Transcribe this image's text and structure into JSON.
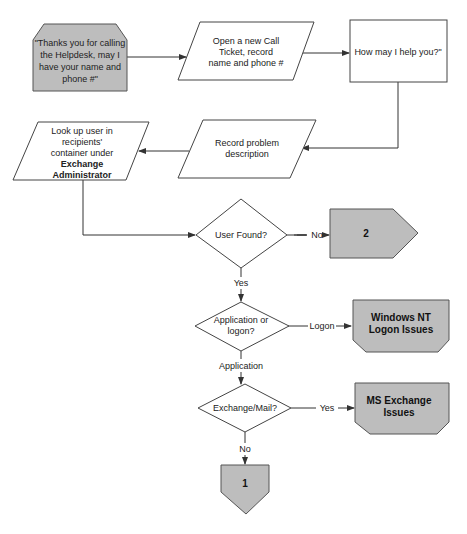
{
  "diagram": {
    "type": "flowchart",
    "nodes": {
      "greeting": {
        "shape": "chamfered-rect",
        "fill": "#bdbdbd",
        "lines": [
          "\"Thanks you for calling",
          "the Helpdesk, may I",
          "have your name and",
          "phone #\""
        ]
      },
      "open_ticket": {
        "shape": "parallelogram",
        "lines": [
          "Open a new Call",
          "Ticket, record",
          "name and phone #"
        ]
      },
      "how_help": {
        "shape": "rectangle",
        "lines": [
          "How may I help you?\""
        ]
      },
      "record_problem": {
        "shape": "parallelogram",
        "lines": [
          "Record problem",
          "description"
        ]
      },
      "lookup_user": {
        "shape": "parallelogram",
        "lines": [
          "Look up user in",
          "recipients'",
          "container under"
        ],
        "bold_lines": [
          "Exchange",
          "Administrator"
        ]
      },
      "user_found": {
        "shape": "diamond",
        "lines": [
          "User Found?"
        ]
      },
      "offpage_2": {
        "shape": "offpage-right",
        "fill": "#bdbdbd",
        "label": "2"
      },
      "app_or_logon": {
        "shape": "diamond",
        "lines": [
          "Application or",
          "logon?"
        ]
      },
      "nt_logon": {
        "shape": "chamfered-bottom-rect",
        "fill": "#bdbdbd",
        "bold_lines": [
          "Windows NT",
          "Logon Issues"
        ]
      },
      "exchange_mail": {
        "shape": "diamond",
        "lines": [
          "Exchange/Mail?"
        ]
      },
      "ms_exchange": {
        "shape": "chamfered-bottom-rect",
        "fill": "#bdbdbd",
        "bold_lines": [
          "MS Exchange",
          "Issues"
        ]
      },
      "offpage_1": {
        "shape": "offpage-down",
        "fill": "#bdbdbd",
        "label": "1"
      }
    },
    "edge_labels": {
      "user_found_no": "No",
      "user_found_yes": "Yes",
      "logon": "Logon",
      "application": "Application",
      "exchange_yes": "Yes",
      "exchange_no": "No"
    },
    "edges": [
      {
        "from": "greeting",
        "to": "open_ticket"
      },
      {
        "from": "open_ticket",
        "to": "how_help"
      },
      {
        "from": "how_help",
        "to": "record_problem"
      },
      {
        "from": "record_problem",
        "to": "lookup_user"
      },
      {
        "from": "lookup_user",
        "to": "user_found"
      },
      {
        "from": "user_found",
        "to": "offpage_2",
        "label": "No"
      },
      {
        "from": "user_found",
        "to": "app_or_logon",
        "label": "Yes"
      },
      {
        "from": "app_or_logon",
        "to": "nt_logon",
        "label": "Logon"
      },
      {
        "from": "app_or_logon",
        "to": "exchange_mail",
        "label": "Application"
      },
      {
        "from": "exchange_mail",
        "to": "ms_exchange",
        "label": "Yes"
      },
      {
        "from": "exchange_mail",
        "to": "offpage_1",
        "label": "No"
      }
    ],
    "colors": {
      "gray_fill": "#bdbdbd",
      "stroke": "#444444",
      "background": "#ffffff"
    }
  }
}
